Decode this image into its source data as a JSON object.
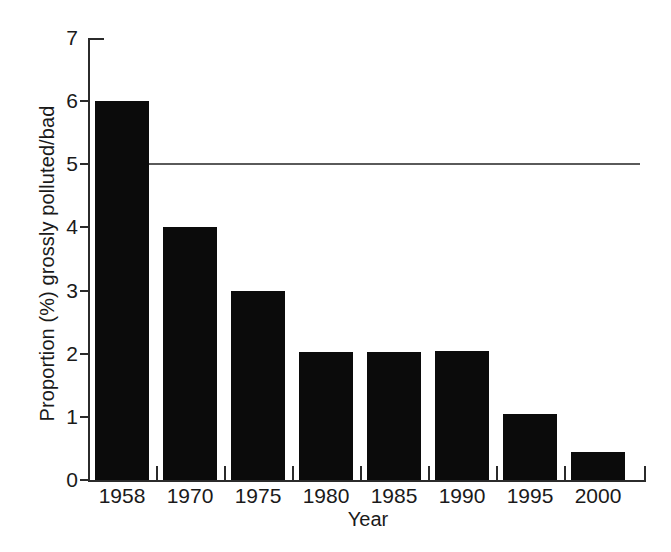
{
  "chart_data": {
    "type": "bar",
    "title": "",
    "subtitle": "",
    "xlabel": "Year",
    "ylabel": "Proportion (%) grossly polluted/bad",
    "categories": [
      "1958",
      "1970",
      "1975",
      "1980",
      "1985",
      "1990",
      "1995",
      "2000"
    ],
    "values": [
      6.0,
      4.0,
      3.0,
      2.03,
      2.03,
      2.05,
      1.05,
      0.45
    ],
    "series": [
      {
        "name": "Proportion (%) grossly polluted/bad",
        "values": [
          6.0,
          4.0,
          3.0,
          2.03,
          2.03,
          2.05,
          1.05,
          0.45
        ]
      }
    ],
    "ylim": [
      0,
      7
    ],
    "ytick_labels": [
      "0",
      "1",
      "2",
      "3",
      "4",
      "5",
      "6",
      "7"
    ],
    "ytick_values": [
      0,
      1,
      2,
      3,
      4,
      5,
      6,
      7
    ],
    "grid": false,
    "legend": false,
    "legend_position": "none",
    "bar_color": "#0b0b0b",
    "annotations": [
      {
        "name": "reference-line",
        "type": "horizontal-line",
        "value": 5.0,
        "color": "#5a5a5a",
        "label": ""
      }
    ]
  },
  "axes": {
    "y_title": "Proportion (%) grossly polluted/bad",
    "x_title": "Year"
  }
}
